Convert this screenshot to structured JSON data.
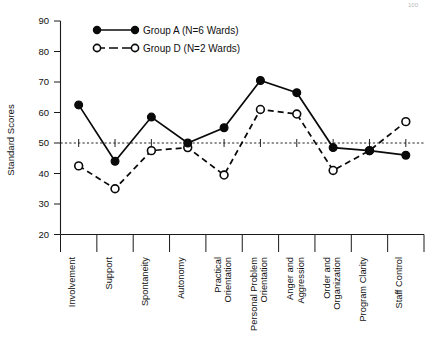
{
  "figure": {
    "ylabel": "Standard Scores",
    "corner_note": "100"
  },
  "legend": {
    "position": "top-left-inside",
    "entries": [
      {
        "key": "A",
        "label": "Group A (N=6 Wards)",
        "marker": "filled-circle",
        "line": "solid"
      },
      {
        "key": "D",
        "label": "Group D (N=2 Wards)",
        "marker": "open-circle",
        "line": "dashed"
      }
    ]
  },
  "axes": {
    "y_ticks": [
      "90",
      "80",
      "70",
      "60",
      "50",
      "40",
      "30",
      "20"
    ],
    "reference_value": 50
  },
  "chart_data": {
    "type": "line",
    "title": "",
    "xlabel": "",
    "ylabel": "Standard Scores",
    "ylim": [
      20,
      90
    ],
    "yticks": [
      20,
      30,
      40,
      50,
      60,
      70,
      80,
      90
    ],
    "grid": false,
    "reference_line": 50,
    "legend_position": "upper left",
    "categories": [
      "Involvement",
      "Support",
      "Spontaneity",
      "Autonomy",
      "Practical Orientation",
      "Personal Problem Orientation",
      "Anger and Aggression",
      "Order and Organization",
      "Program Clarity",
      "Staff Control"
    ],
    "series": [
      {
        "name": "Group A (N=6 Wards)",
        "marker": "filled-circle",
        "linestyle": "solid",
        "values": [
          62.5,
          44.0,
          58.5,
          50.0,
          55.0,
          70.5,
          66.5,
          48.5,
          47.5,
          46.0
        ]
      },
      {
        "name": "Group D (N=2 Wards)",
        "marker": "open-circle",
        "linestyle": "dashed",
        "values": [
          42.5,
          35.0,
          47.5,
          48.5,
          39.5,
          61.0,
          59.5,
          41.0,
          47.5,
          57.0
        ]
      }
    ]
  }
}
